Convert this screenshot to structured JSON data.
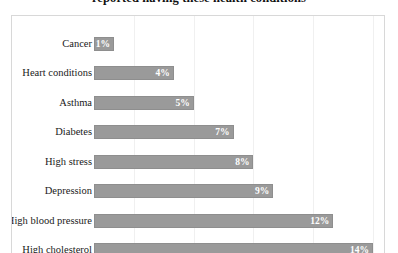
{
  "chart": {
    "title": "reported having these health conditions",
    "value_suffix": "%",
    "bar_color": "#9a9a9a",
    "bar_border_color": "#8e8e8e",
    "plot_border_color": "#d8d8d8",
    "gridline_color": "#f0f0f0",
    "value_label_color": "#ffffff",
    "category_label_color": "#1a1a1a"
  },
  "chart_data": {
    "type": "bar",
    "orientation": "horizontal",
    "title": "reported having these health conditions",
    "xlabel": "",
    "ylabel": "",
    "xlim": [
      0,
      14
    ],
    "grid": true,
    "legend": "none",
    "categories": [
      "Cancer",
      "Heart conditions",
      "Asthma",
      "Diabetes",
      "High stress",
      "Depression",
      "High blood pressure",
      "High cholesterol"
    ],
    "values": [
      1,
      4,
      5,
      7,
      8,
      9,
      12,
      14
    ],
    "data_labels": [
      "1%",
      "4%",
      "5%",
      "7%",
      "8%",
      "9%",
      "12%",
      "14%"
    ],
    "bars": [
      {
        "label": "Cancer",
        "value": 1,
        "display": "1%"
      },
      {
        "label": "Heart conditions",
        "value": 4,
        "display": "4%"
      },
      {
        "label": "Asthma",
        "value": 5,
        "display": "5%"
      },
      {
        "label": "Diabetes",
        "value": 7,
        "display": "7%"
      },
      {
        "label": "High stress",
        "value": 8,
        "display": "8%"
      },
      {
        "label": "Depression",
        "value": 9,
        "display": "9%"
      },
      {
        "label": "High blood pressure",
        "value": 12,
        "display": "12%"
      },
      {
        "label": "High cholesterol",
        "value": 14,
        "display": "14%"
      }
    ],
    "gridline_values": [
      2,
      5,
      8,
      11,
      14
    ]
  }
}
